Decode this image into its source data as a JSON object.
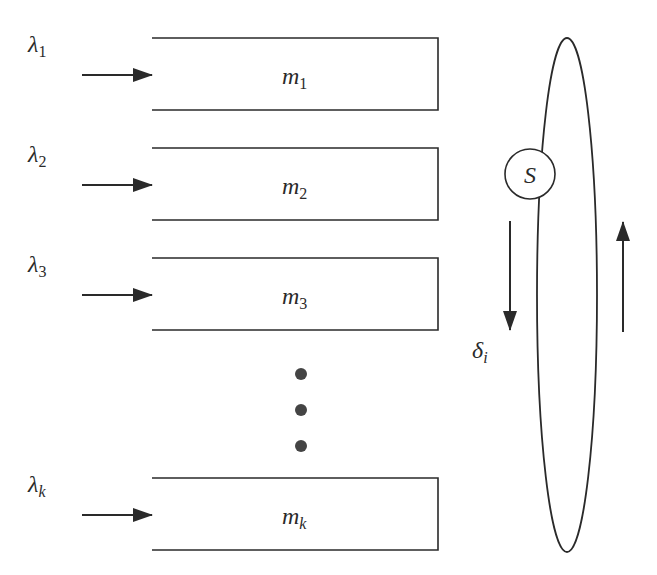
{
  "diagram": {
    "type": "polling-system",
    "queues": [
      {
        "arrival_symbol": "λ",
        "arrival_index": "1",
        "buffer_symbol": "m",
        "buffer_index": "1",
        "y": 38
      },
      {
        "arrival_symbol": "λ",
        "arrival_index": "2",
        "buffer_symbol": "m",
        "buffer_index": "2",
        "y": 148
      },
      {
        "arrival_symbol": "λ",
        "arrival_index": "3",
        "buffer_symbol": "m",
        "buffer_index": "3",
        "y": 258
      },
      {
        "arrival_symbol": "λ",
        "arrival_index": "k",
        "buffer_symbol": "m",
        "buffer_index": "k",
        "y": 478
      }
    ],
    "ellipsis_dots": 3,
    "server": {
      "label": "S"
    },
    "switchover": {
      "symbol": "δ",
      "index": "i"
    },
    "colors": {
      "line": "#2a2a2a",
      "dot": "#444444",
      "background": "#ffffff"
    }
  }
}
